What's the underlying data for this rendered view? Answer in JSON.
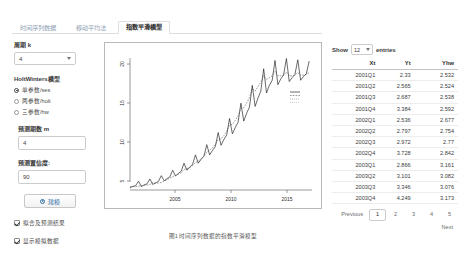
{
  "tabs": [
    {
      "label": "时间序列数据",
      "active": false
    },
    {
      "label": "移动平均法",
      "active": false
    },
    {
      "label": "指数平滑模型",
      "active": true
    }
  ],
  "sidebar": {
    "period_label": "周期 k",
    "period_value": "4",
    "model_group_title": "HoltWinters模型",
    "model_options": [
      {
        "label": "单参数/ses",
        "selected": true
      },
      {
        "label": "两参数/holt",
        "selected": false
      },
      {
        "label": "三参数/hw",
        "selected": false
      }
    ],
    "horizon_label": "预测期数 m",
    "horizon_value": "4",
    "confidence_label": "预测置信度:",
    "confidence_value": "90",
    "run_button": "建模",
    "run_icon": "play-circle-icon",
    "checkboxes": [
      {
        "label": "拟合及预测结果",
        "checked": true
      },
      {
        "label": "显示模拟数据",
        "checked": true
      }
    ]
  },
  "plot": {
    "caption": "图1  时间序列数据的指数平滑模型",
    "y_ticks": [
      "20",
      "15",
      "10",
      "5"
    ],
    "x_ticks": [
      "2005",
      "2010",
      "2015"
    ],
    "legend": "----"
  },
  "chart_data": {
    "type": "line",
    "title": "",
    "xlabel": "",
    "ylabel": "",
    "xlim": [
      2001,
      2017
    ],
    "ylim": [
      2,
      23
    ],
    "grid": false,
    "legend_position": "right",
    "xticks": [
      2005,
      2010,
      2015
    ],
    "yticks": [
      5,
      10,
      15,
      20
    ],
    "series": [
      {
        "name": "Yt",
        "x": [
          2001.0,
          2001.25,
          2001.5,
          2001.75,
          2002.0,
          2002.25,
          2002.5,
          2002.75,
          2003.0,
          2003.25,
          2003.5,
          2003.75,
          2004.0,
          2004.25,
          2004.5,
          2004.75,
          2005.0,
          2005.25,
          2005.5,
          2005.75,
          2006.0,
          2006.25,
          2006.5,
          2006.75,
          2007.0,
          2007.25,
          2007.5,
          2007.75,
          2008.0,
          2008.25,
          2008.5,
          2008.75,
          2009.0,
          2009.25,
          2009.5,
          2009.75,
          2010.0,
          2010.25,
          2010.5,
          2010.75,
          2011.0,
          2011.25,
          2011.5,
          2011.75,
          2012.0,
          2012.25,
          2012.5,
          2012.75,
          2013.0,
          2013.25,
          2013.5,
          2013.75,
          2014.0,
          2014.25,
          2014.5,
          2014.75,
          2015.0,
          2015.25,
          2015.5,
          2015.75,
          2016.0,
          2016.25,
          2016.5,
          2016.75
        ],
        "values": [
          2.33,
          2.565,
          2.687,
          3.384,
          2.536,
          2.797,
          2.972,
          3.728,
          2.866,
          3.101,
          3.346,
          4.249,
          3.45,
          3.78,
          4.06,
          5.1,
          4.2,
          4.6,
          4.95,
          6.2,
          5.1,
          5.6,
          6.0,
          7.5,
          6.2,
          6.8,
          7.3,
          9.1,
          7.5,
          8.2,
          8.8,
          11.0,
          9.0,
          9.9,
          10.6,
          13.2,
          10.8,
          11.8,
          12.6,
          15.6,
          12.8,
          14.0,
          15.0,
          18.4,
          15.1,
          16.4,
          17.5,
          21.0,
          17.2,
          18.4,
          19.2,
          22.3,
          18.5,
          19.4,
          20.0,
          22.6,
          19.0,
          19.6,
          20.1,
          22.4,
          19.2,
          19.8,
          20.2,
          22.2
        ]
      },
      {
        "name": "Yhw",
        "x": [
          2001.0,
          2001.25,
          2001.5,
          2001.75,
          2002.0,
          2002.25,
          2002.5,
          2002.75,
          2003.0,
          2003.25,
          2003.5,
          2003.75,
          2004.0,
          2004.25,
          2004.5,
          2004.75,
          2005.0,
          2005.25,
          2005.5,
          2005.75,
          2006.0,
          2006.25,
          2006.5,
          2006.75,
          2007.0,
          2007.25,
          2007.5,
          2007.75,
          2008.0,
          2008.25,
          2008.5,
          2008.75,
          2009.0,
          2009.25,
          2009.5,
          2009.75,
          2010.0,
          2010.25,
          2010.5,
          2010.75,
          2011.0,
          2011.25,
          2011.5,
          2011.75,
          2012.0,
          2012.25,
          2012.5,
          2012.75,
          2013.0,
          2013.25,
          2013.5,
          2013.75,
          2014.0,
          2014.25,
          2014.5,
          2014.75,
          2015.0,
          2015.25,
          2015.5,
          2015.75,
          2016.0,
          2016.25,
          2016.5,
          2016.75
        ],
        "values": [
          2.532,
          2.524,
          2.538,
          2.592,
          2.677,
          2.754,
          2.77,
          2.842,
          3.161,
          3.082,
          3.076,
          3.173,
          3.4,
          3.6,
          3.85,
          4.1,
          4.3,
          4.45,
          4.7,
          5.2,
          5.35,
          5.5,
          5.8,
          6.3,
          6.5,
          6.9,
          7.3,
          8.0,
          8.2,
          8.6,
          9.1,
          9.9,
          10.0,
          10.5,
          11.2,
          12.2,
          12.3,
          12.9,
          13.6,
          14.8,
          14.9,
          15.6,
          16.5,
          17.9,
          17.5,
          18.2,
          18.9,
          19.9,
          19.3,
          19.6,
          19.9,
          20.6,
          19.9,
          19.9,
          20.0,
          20.5,
          19.9,
          19.9,
          20.0,
          20.4,
          20.0,
          20.0,
          20.1,
          20.4
        ]
      }
    ]
  },
  "table": {
    "show_label": "Show",
    "show_value": "12",
    "entries_label": "entries",
    "headers": [
      "Xt",
      "Yt",
      "Yhw"
    ],
    "rows": [
      [
        "2001Q1",
        "2.33",
        "2.532"
      ],
      [
        "2001Q2",
        "2.565",
        "2.524"
      ],
      [
        "2001Q3",
        "2.687",
        "2.538"
      ],
      [
        "2001Q4",
        "3.384",
        "2.592"
      ],
      [
        "2002Q1",
        "2.536",
        "2.677"
      ],
      [
        "2002Q2",
        "2.797",
        "2.754"
      ],
      [
        "2002Q3",
        "2.972",
        "2.77"
      ],
      [
        "2002Q4",
        "3.728",
        "2.842"
      ],
      [
        "2003Q1",
        "2.866",
        "3.161"
      ],
      [
        "2003Q2",
        "3.101",
        "3.082"
      ],
      [
        "2003Q3",
        "3.346",
        "3.076"
      ],
      [
        "2003Q4",
        "4.249",
        "3.173"
      ]
    ],
    "pagination": {
      "previous": "Previous",
      "pages": [
        "1",
        "2",
        "3",
        "4",
        "5"
      ],
      "active_page": "1",
      "next": "Next"
    }
  }
}
